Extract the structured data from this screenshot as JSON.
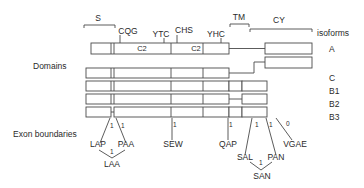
{
  "labels": {
    "domains": "Domains",
    "exon_boundaries": "Exon boundaries",
    "isoforms": "isoforms"
  },
  "regions": {
    "signal": "S",
    "transmembrane": "TM",
    "cytoplasmic": "CY"
  },
  "motifs": [
    "CQG",
    "YTC",
    "CHS",
    "YHC"
  ],
  "domain_labels": [
    "C2",
    "C2"
  ],
  "isoform_names": [
    "A",
    "C",
    "B1",
    "B2",
    "B3"
  ],
  "exon_boundary_sites": {
    "LAP": "LAP",
    "PAA": "PAA",
    "LAA": "LAA",
    "SEW": "SEW",
    "QAP": "QAP",
    "SAL": "SAL",
    "PAN": "PAN",
    "SAN": "SAN",
    "VGAE": "VGAE"
  },
  "phases": {
    "LAP": "1",
    "PAA": "1",
    "LAA": "1",
    "SEW": "1",
    "QAP": "1",
    "SAL": "1",
    "PAN": "1",
    "SAN": "1",
    "VGAE": "0"
  }
}
